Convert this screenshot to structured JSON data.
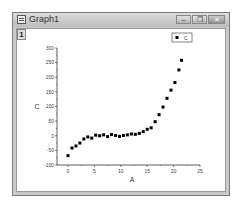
{
  "window": {
    "title": "Graph1",
    "layer_label": "1",
    "buttons": {
      "minimize": "–",
      "restore": "❐",
      "close": "✕"
    }
  },
  "chart_data": {
    "type": "scatter",
    "title": "",
    "xlabel": "A",
    "ylabel": "C",
    "xlim": [
      -2,
      25
    ],
    "ylim": [
      -100,
      300
    ],
    "xticks": [
      0,
      5,
      10,
      15,
      20,
      25
    ],
    "yticks": [
      -100,
      -50,
      0,
      50,
      100,
      150,
      200,
      250,
      300
    ],
    "grid": false,
    "legend": {
      "position": "top-right",
      "entries": [
        "C"
      ]
    },
    "series": [
      {
        "name": "C",
        "marker": "square",
        "color": "#000000",
        "x": [
          0,
          0.75,
          1.5,
          2.25,
          3,
          3.75,
          4.5,
          5.25,
          6,
          6.75,
          7.5,
          8.25,
          9,
          9.75,
          10.5,
          11.25,
          12,
          12.75,
          13.5,
          14.25,
          15,
          15.75,
          16.5,
          17.25,
          18,
          18.75,
          19.5,
          20.25,
          21,
          21.5
        ],
        "y": [
          -68,
          -42,
          -35,
          -25,
          -11,
          -4,
          -8,
          2,
          0,
          3,
          -3,
          4,
          1,
          -2,
          1,
          3,
          6,
          5,
          8,
          14,
          22,
          27,
          48,
          72,
          98,
          128,
          156,
          182,
          225,
          258
        ]
      }
    ]
  }
}
